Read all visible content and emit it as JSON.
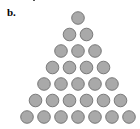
{
  "figure": {
    "label": "b."
  },
  "diagram": {
    "type": "triangular-circle-array",
    "rows": [
      1,
      2,
      3,
      4,
      5,
      6,
      7
    ],
    "total_circles": 28,
    "circle_fill": "#a9a9a9",
    "circle_stroke": "#6e6e6e",
    "apex_center": [
      78,
      18
    ],
    "pitch_x": 17,
    "pitch_y": 16.5,
    "radius": 6.3
  }
}
